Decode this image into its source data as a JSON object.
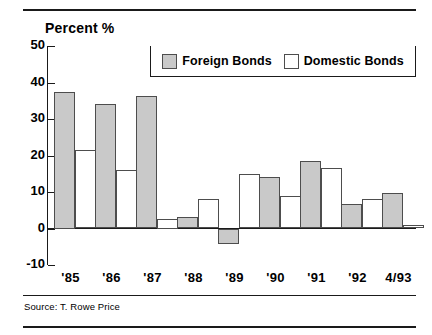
{
  "figure": {
    "percent_label": "Percent %",
    "source": "Source: T. Rowe Price"
  },
  "legend": {
    "items": [
      {
        "label": "Foreign Bonds",
        "swatch": "gray-swatch-icon",
        "color": "#c9c9c9"
      },
      {
        "label": "Domestic Bonds",
        "swatch": "white-swatch-icon",
        "color": "#ffffff"
      }
    ]
  },
  "axis": {
    "y_ticks": [
      "50",
      "40",
      "30",
      "20",
      "10",
      "0",
      "-10"
    ],
    "x_ticks": [
      "'85",
      "'86",
      "'87",
      "'88",
      "'89",
      "'90",
      "'91",
      "'92",
      "4/93"
    ]
  },
  "chart_data": {
    "type": "bar",
    "title": "Percent %",
    "subtitle": "",
    "xlabel": "",
    "ylabel": "Percent %",
    "categories": [
      "'85",
      "'86",
      "'87",
      "'88",
      "'89",
      "'90",
      "'91",
      "'92",
      "4/93"
    ],
    "series": [
      {
        "name": "Foreign Bonds",
        "color": "#c9c9c9",
        "values": [
          37.5,
          34.0,
          36.2,
          3.2,
          -4.2,
          14.2,
          18.4,
          6.8,
          9.7
        ]
      },
      {
        "name": "Domestic Bonds",
        "color": "#ffffff",
        "values": [
          21.5,
          15.9,
          2.5,
          8.0,
          14.8,
          8.8,
          16.7,
          8.2,
          1.0
        ]
      }
    ],
    "ylim": [
      -10,
      50
    ],
    "ytick_step": 10,
    "grid": false,
    "legend_position": "top-right-inside",
    "source": "Source: T. Rowe Price"
  }
}
